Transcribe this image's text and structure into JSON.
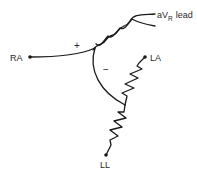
{
  "diagram": {
    "nodes": {
      "ra": "RA",
      "la": "LA",
      "ll": "LL"
    },
    "lead": {
      "prefix": "aV",
      "subscript": "R",
      "suffix": "lead"
    },
    "polarity": {
      "positive": "+",
      "negative": "−"
    },
    "colors": {
      "line": "#1a1a1a",
      "background": "#ffffff"
    }
  }
}
